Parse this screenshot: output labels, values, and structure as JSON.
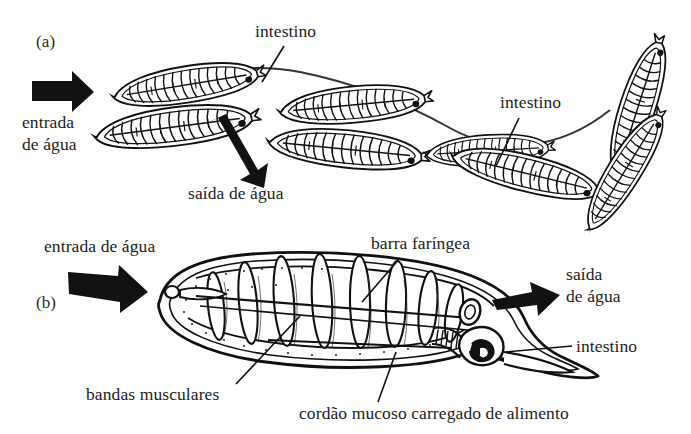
{
  "figure": {
    "background_color": "#ffffff",
    "ink_color": "#111111",
    "panels": [
      {
        "id": "a",
        "id_label": "(a)",
        "description": "Cadeia de zooides coloniais mostrando fluxo de agua atraves das cestas branquiais"
      },
      {
        "id": "b",
        "id_label": "(b)",
        "description": "Zooide individual em corte mostrando bandas musculares, barra faringea e intestino"
      }
    ],
    "labels": {
      "panel_a_id": "(a)",
      "panel_b_id": "(b)",
      "entrada_agua_a_line1": "entrada",
      "entrada_agua_a_line2": "de água",
      "saida_agua_a": "saída de água",
      "intestino_a_top": "intestino",
      "intestino_a_right": "intestino",
      "entrada_agua_b": "entrada de água",
      "barra_faringea": "barra faríngea",
      "saida_agua_b_line1": "saída",
      "saida_agua_b_line2": "de água",
      "intestino_b": "intestino",
      "bandas_musculares": "bandas musculares",
      "cordao_mucoso": "cordão mucoso carregado de alimento"
    },
    "colors": {
      "ink": "#111111",
      "paper": "#ffffff",
      "text": "#1d1d1d",
      "stipple": "#333333"
    }
  }
}
